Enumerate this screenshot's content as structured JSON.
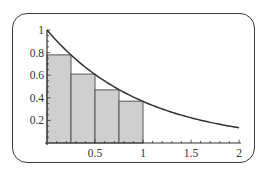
{
  "chart_data": {
    "type": "bar",
    "title": "",
    "xlabel": "",
    "ylabel": "",
    "categories": [
      "0-0.25",
      "0.25-0.5",
      "0.5-0.75",
      "0.75-1"
    ],
    "bar_edges": [
      0,
      0.25,
      0.5,
      0.75,
      1.0
    ],
    "values": [
      0.78,
      0.61,
      0.47,
      0.37
    ],
    "curve": {
      "name": "y = e^(-x)",
      "x": [
        0,
        0.25,
        0.5,
        0.75,
        1.0,
        1.25,
        1.5,
        1.75,
        2.0
      ],
      "y": [
        1.0,
        0.78,
        0.61,
        0.47,
        0.37,
        0.29,
        0.22,
        0.17,
        0.14
      ]
    },
    "xlim": [
      0,
      2
    ],
    "ylim": [
      0,
      1
    ],
    "xticks": [
      0.5,
      1,
      1.5,
      2
    ],
    "xtick_labels": [
      "0.5",
      "1",
      "1.5",
      "2"
    ],
    "yticks": [
      0.2,
      0.4,
      0.6,
      0.8,
      1
    ],
    "ytick_labels": [
      "0.2",
      "0.4",
      "0.6",
      "0.8",
      "1"
    ],
    "grid": false,
    "legend": null,
    "colors": {
      "bar_fill": "#cfcfcf",
      "bar_edge": "#555555",
      "curve": "#333333",
      "axis": "#333333",
      "frame": "#3a3a3a"
    }
  }
}
